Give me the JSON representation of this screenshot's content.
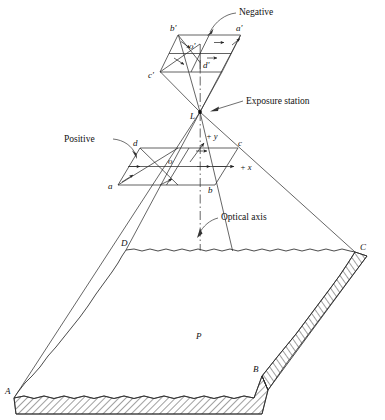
{
  "figure": {
    "background_color": "#ffffff",
    "line_color": "#2b2b2b"
  },
  "callouts": {
    "negative": "Negative",
    "exposure_station": "Exposure station",
    "positive": "Positive",
    "optical_axis": "Optical axis"
  },
  "negative_plane": {
    "corner_a": "a'",
    "corner_b": "b'",
    "corner_c": "c'",
    "corner_d": "d'",
    "center": "o'"
  },
  "positive_plane": {
    "corner_a": "a",
    "corner_b": "b",
    "corner_c": "c",
    "corner_d": "d",
    "center": "o",
    "axis_x": "+ x",
    "axis_y": "+ y"
  },
  "exposure": {
    "station_label": "L"
  },
  "ground": {
    "corner_a": "A",
    "corner_b": "B",
    "corner_c": "C",
    "corner_d": "D",
    "principal_point": "P"
  }
}
